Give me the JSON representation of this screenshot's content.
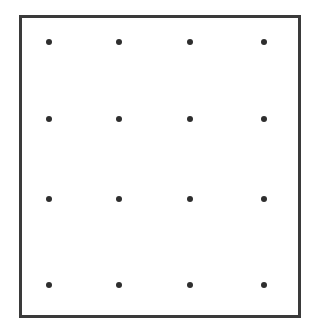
{
  "diagram": {
    "type": "dot-grid",
    "rows": 4,
    "columns": 4,
    "frame": {
      "stroke_color": "#3a3a3a",
      "fill_color": "#ffffff"
    },
    "dot_color": "#2e2e2e",
    "column_positions_px": [
      49,
      119,
      190,
      264
    ],
    "row_positions_px": [
      42,
      119,
      199,
      285
    ],
    "dots": [
      {
        "row": 0,
        "col": 0
      },
      {
        "row": 0,
        "col": 1
      },
      {
        "row": 0,
        "col": 2
      },
      {
        "row": 0,
        "col": 3
      },
      {
        "row": 1,
        "col": 0
      },
      {
        "row": 1,
        "col": 1
      },
      {
        "row": 1,
        "col": 2
      },
      {
        "row": 1,
        "col": 3
      },
      {
        "row": 2,
        "col": 0
      },
      {
        "row": 2,
        "col": 1
      },
      {
        "row": 2,
        "col": 2
      },
      {
        "row": 2,
        "col": 3
      },
      {
        "row": 3,
        "col": 0
      },
      {
        "row": 3,
        "col": 1
      },
      {
        "row": 3,
        "col": 2
      },
      {
        "row": 3,
        "col": 3
      }
    ]
  }
}
